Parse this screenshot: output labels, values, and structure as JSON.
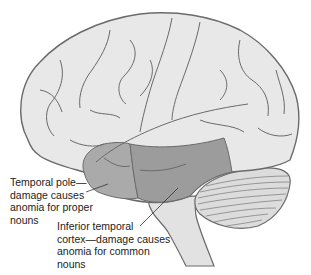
{
  "diagram": {
    "colors": {
      "cortex_fill": "#e6e6e6",
      "outline": "#6a6a6a",
      "temporal_pole_fill": "#a9a9a9",
      "inferior_temporal_fill": "#9a9a9a",
      "cerebellum_fill": "#dcdcdc",
      "brainstem_fill": "#e2e2e2"
    },
    "labels": [
      {
        "id": "temporal-pole",
        "lines": [
          "Temporal pole—",
          "damage causes",
          "anomia for proper",
          "nouns"
        ]
      },
      {
        "id": "inferior-temporal-cortex",
        "lines": [
          "Inferior temporal",
          "cortex—damage causes",
          "anomia for common",
          "nouns"
        ]
      }
    ]
  }
}
